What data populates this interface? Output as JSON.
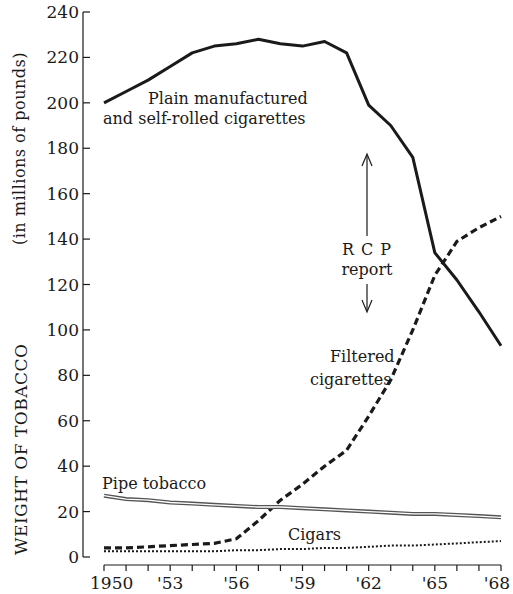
{
  "chart_data": {
    "type": "line",
    "title": "",
    "xlabel": "",
    "ylabel": "WEIGHT OF TOBACCO",
    "ylabel_units": "(in millions of pounds)",
    "ylim": [
      0,
      240
    ],
    "xlim": [
      1950,
      1968
    ],
    "y_ticks": [
      "0",
      "20",
      "40",
      "60",
      "80",
      "100",
      "120",
      "140",
      "160",
      "180",
      "200",
      "220",
      "240"
    ],
    "x_tick_labels": [
      {
        "year": 1950,
        "label": "1950"
      },
      {
        "year": 1953,
        "label": "'53"
      },
      {
        "year": 1956,
        "label": "'56"
      },
      {
        "year": 1959,
        "label": "'59"
      },
      {
        "year": 1962,
        "label": "'62"
      },
      {
        "year": 1965,
        "label": "'65"
      },
      {
        "year": 1968,
        "label": "'68"
      }
    ],
    "grid": false,
    "legend": "inline labels",
    "x": [
      1950,
      1951,
      1952,
      1953,
      1954,
      1955,
      1956,
      1957,
      1958,
      1959,
      1960,
      1961,
      1962,
      1963,
      1964,
      1965,
      1966,
      1967,
      1968
    ],
    "series": [
      {
        "name": "Plain manufactured and self-rolled cigarettes",
        "style": "solid",
        "values": [
          200,
          205,
          210,
          216,
          222,
          225,
          226,
          228,
          226,
          225,
          227,
          222,
          199,
          190,
          176,
          134,
          122,
          108,
          93
        ]
      },
      {
        "name": "Filtered cigarettes",
        "style": "dashed",
        "values": [
          4,
          4,
          4.5,
          5,
          5.5,
          6,
          8,
          16,
          25,
          32,
          40,
          47,
          62,
          78,
          100,
          124,
          139,
          145,
          150
        ]
      },
      {
        "name": "Pipe tobacco",
        "style": "double",
        "values": [
          27,
          25.5,
          25,
          24,
          23.5,
          23,
          22.5,
          22,
          22,
          21.5,
          21,
          20.5,
          20,
          19.5,
          19,
          19,
          18.5,
          18,
          17.5
        ]
      },
      {
        "name": "Cigars",
        "style": "dotted",
        "values": [
          2.5,
          2.5,
          2.5,
          2.5,
          2.5,
          2.5,
          3,
          3,
          3.5,
          3.5,
          4,
          4,
          4.5,
          5,
          5,
          5.5,
          6,
          6.5,
          7
        ]
      }
    ],
    "annotations": [
      {
        "text": "RCP report",
        "lines": [
          "R C P",
          "report"
        ],
        "year": 1962.1,
        "arrows": "up-down"
      }
    ]
  },
  "labels": {
    "plain_line1": "Plain manufactured",
    "plain_line2": "and self-rolled cigarettes",
    "filtered_line1": "Filtered",
    "filtered_line2": "cigarettes",
    "pipe": "Pipe tobacco",
    "cigars": "Cigars",
    "rcp_line1": "R C P",
    "rcp_line2": "report",
    "ylabel": "WEIGHT OF TOBACCO",
    "ylabel_units": "(in millions of pounds)"
  },
  "colors": {
    "ink": "#1a1a1a",
    "background": "#ffffff",
    "pipe_inner": "#ffffff"
  }
}
